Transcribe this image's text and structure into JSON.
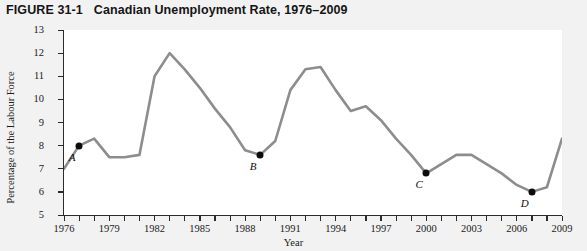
{
  "figure": {
    "number": "FIGURE 31-1",
    "title": "Canadian Unemployment Rate, 1976–2009"
  },
  "chart_data": {
    "type": "line",
    "title": "Canadian Unemployment Rate, 1976–2009",
    "xlabel": "Year",
    "ylabel": "Percentage of the Labour Force",
    "xlim": [
      1976,
      2009
    ],
    "ylim": [
      5,
      13
    ],
    "grid": false,
    "legend": "none",
    "line_color": "#8d8d8d",
    "marker_color": "#0c0c0c",
    "x": [
      1976,
      1977,
      1978,
      1979,
      1980,
      1981,
      1982,
      1983,
      1984,
      1985,
      1986,
      1987,
      1988,
      1989,
      1990,
      1991,
      1992,
      1993,
      1994,
      1995,
      1996,
      1997,
      1998,
      1999,
      2000,
      2001,
      2002,
      2003,
      2004,
      2005,
      2006,
      2007,
      2008,
      2009
    ],
    "values": [
      7.0,
      8.0,
      8.3,
      7.5,
      7.5,
      7.6,
      11.0,
      12.0,
      11.3,
      10.5,
      9.6,
      8.8,
      7.8,
      7.6,
      8.2,
      10.4,
      11.3,
      11.4,
      10.4,
      9.5,
      9.7,
      9.1,
      8.3,
      7.6,
      6.8,
      7.2,
      7.6,
      7.6,
      7.2,
      6.8,
      6.3,
      6.0,
      6.2,
      8.3
    ],
    "ytick_labels": [
      "13",
      "12",
      "11",
      "10",
      "9",
      "8",
      "7",
      "6",
      "5"
    ],
    "xtick_labels": [
      "1976",
      "1979",
      "1982",
      "1985",
      "1988",
      "1991",
      "1994",
      "1997",
      "2000",
      "2003",
      "2006",
      "2009"
    ],
    "annotations": [
      {
        "label": "A",
        "year": 1977,
        "value": 8.0
      },
      {
        "label": "B",
        "year": 1989,
        "value": 7.6
      },
      {
        "label": "C",
        "year": 2000,
        "value": 6.8
      },
      {
        "label": "D",
        "year": 2007,
        "value": 6.0
      }
    ]
  }
}
